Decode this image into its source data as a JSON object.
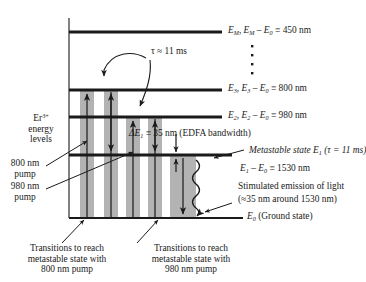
{
  "figure": {
    "kind": "energy-level-diagram",
    "ion_label_main": "Er",
    "ion_label_charge": "3+",
    "ion_label_line2": "energy",
    "ion_label_line3": "levels",
    "colors": {
      "band_gray": "#b3b3b3",
      "band_gray_edge": "#9a9a9a",
      "line_black": "#1a1a1a",
      "background": "#ffffff"
    }
  },
  "levels": [
    {
      "id": "EM",
      "name_italic": "E",
      "name_sub": "M",
      "label_full": "E_M,  E_M − E_0 ≡ 450 nm",
      "part_a": "E",
      "part_a_sub": "M",
      "part_b": ",",
      "part_c": "E",
      "part_c_sub": "M",
      "part_d": " – ",
      "part_e": "E",
      "part_e_sub": "0",
      "part_f": " ≡ 450 nm",
      "wavelength": "450 nm"
    },
    {
      "id": "E3",
      "label_full": "E_3,  E_3 − E_0 ≡ 800 nm",
      "part_a": "E",
      "part_a_sub": "3",
      "part_b": ",",
      "part_c": "E",
      "part_c_sub": "3",
      "part_d": " – ",
      "part_e": "E",
      "part_e_sub": "0",
      "part_f": " ≡ 800 nm",
      "wavelength": "800 nm"
    },
    {
      "id": "E2",
      "label_full": "E_2,  E_2 − E_0 ≡ 980 nm",
      "part_a": "E",
      "part_a_sub": "2",
      "part_b": ",",
      "part_c": "E",
      "part_c_sub": "2",
      "part_d": " – ",
      "part_e": "E",
      "part_e_sub": "0",
      "part_f": " ≡ 980 nm",
      "wavelength": "980 nm"
    },
    {
      "id": "E1",
      "label_full": "E_1 − E_0 ≡ 1530 nm",
      "part_a": "E",
      "part_a_sub": "1",
      "part_d": " – ",
      "part_e": "E",
      "part_e_sub": "0",
      "part_f": " ≡ 1530 nm",
      "wavelength": "1530 nm"
    },
    {
      "id": "E0",
      "label_full": "E_0 (Ground state)",
      "part_a": "E",
      "part_a_sub": "0",
      "part_f": " (Ground state)"
    }
  ],
  "vertical_dots": "⋮",
  "annotations": {
    "tau_arrow": "τ ≈ 11 ms",
    "delta_e1_a": "ΔE",
    "delta_e1_sub": "1",
    "delta_e1_b": " ≡ 35 nm (EDFA bandwidth)",
    "metastable_a": "Metastable state ",
    "metastable_e": "E",
    "metastable_sub": "1",
    "metastable_b": " (τ = 11 ms)",
    "stim_line1": "Stimulated emission of light",
    "stim_line2": "(≈35 nm around 1530 nm)"
  },
  "left_labels": {
    "pump800_line1": "800 nm",
    "pump800_line2": "pump",
    "pump980_line1": "980 nm",
    "pump980_line2": "pump"
  },
  "captions": [
    {
      "id": "caption-800",
      "line1": "Transitions to reach",
      "line2": "metastable state with",
      "line3": "800 nm pump"
    },
    {
      "id": "caption-980",
      "line1": "Transitions to reach",
      "line2": "metastable state with",
      "line3": "980 nm pump"
    }
  ]
}
